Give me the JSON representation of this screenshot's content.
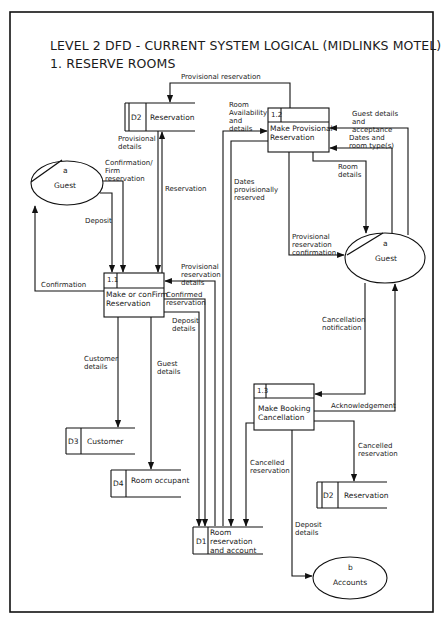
{
  "title": {
    "line1": "LEVEL 2 DFD - CURRENT SYSTEM LOGICAL (MIDLINKS MOTEL)",
    "line2": "1. RESERVE ROOMS"
  },
  "processes": [
    {
      "id": "1.1",
      "label": "Make or conFirm\nReservation"
    },
    {
      "id": "1.2",
      "label": "Make Provisional\nReservation"
    },
    {
      "id": "1.3",
      "label": "Make Booking\nCancellation"
    }
  ],
  "externals": [
    {
      "code": "a",
      "label": "Guest",
      "position": "left"
    },
    {
      "code": "a",
      "label": "Guest",
      "position": "right"
    },
    {
      "code": "b",
      "label": "Accounts"
    }
  ],
  "stores": [
    {
      "id": "D2",
      "label": "Reservation",
      "position": "top"
    },
    {
      "id": "D3",
      "label": "Customer"
    },
    {
      "id": "D4",
      "label": "Room occupant"
    },
    {
      "id": "D1",
      "label": "Room\nreservation\nand account"
    },
    {
      "id": "D2",
      "label": "Reservation",
      "position": "bottom"
    }
  ],
  "flows": {
    "provisional_reservation": "Provisional reservation",
    "provisional_details": "Provisional\ndetails",
    "reservation": "Reservation",
    "confirmation_firm": "Confirmation/\nFirm\nreservation",
    "deposit": "Deposit",
    "confirmation": "Confirmation",
    "room_availability": "Room\nAvailability\nand\ndetails",
    "dates_provisionally_reserved": "Dates\nprovisionally\nreserved",
    "guest_details_acceptance": "Guest details\nand\nacceptance",
    "dates_room_types": "Dates and\nroom type(s)",
    "room_details": "Room\ndetails",
    "provisional_reservation_confirmation": "Provisional\nreservation\nconfirmation",
    "provisional_reservation_details": "Provisional\nreservation\ndetails",
    "confirmed_reservation": "Confirmed\nreservation",
    "deposit_details_1": "Deposit\ndetails",
    "customer_details": "Customer\ndetails",
    "guest_details": "Guest\ndetails",
    "cancellation_notification": "Cancellation\nnotification",
    "acknowledgement": "Acknowledgement",
    "cancelled_reservation_right": "Cancelled\nreservation",
    "cancelled_reservation_left": "Cancelled\nreservation",
    "deposit_details_2": "Deposit\ndetails"
  }
}
